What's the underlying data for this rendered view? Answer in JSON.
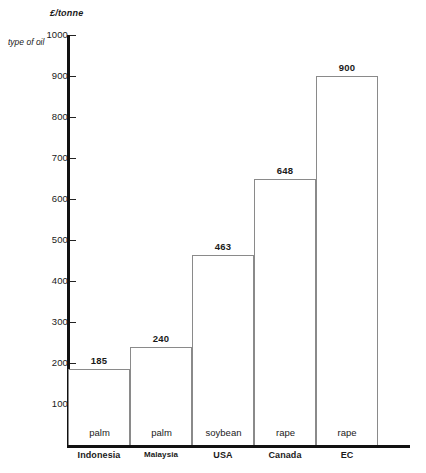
{
  "chart_data": {
    "type": "bar",
    "title": "",
    "xlabel": "",
    "ylabel": "£/tonne",
    "ylim": [
      0,
      1000
    ],
    "yticks": [
      100,
      200,
      300,
      400,
      500,
      600,
      700,
      800,
      900,
      1000
    ],
    "grid": false,
    "legend": "none",
    "categories": [
      "Indonesia",
      "Malaysia",
      "USA",
      "Canada",
      "EC"
    ],
    "values": [
      185,
      240,
      463,
      648,
      900
    ],
    "value_labels": [
      "185",
      "240",
      "463",
      "648",
      "900"
    ],
    "row_label": "type of oil",
    "oil_types": [
      "palm",
      "palm",
      "soybean",
      "rape",
      "rape"
    ],
    "series": [
      {
        "name": "price",
        "values": [
          185,
          240,
          463,
          648,
          900
        ]
      }
    ],
    "points": [
      {
        "category": "Indonesia",
        "oil": "palm",
        "value": 185
      },
      {
        "category": "Malaysia",
        "oil": "palm",
        "value": 240
      },
      {
        "category": "USA",
        "oil": "soybean",
        "value": 463
      },
      {
        "category": "Canada",
        "oil": "rape",
        "value": 648
      },
      {
        "category": "EC",
        "oil": "rape",
        "value": 900
      }
    ],
    "colors": {
      "bar_fill": "#ffffff",
      "bar_stroke": "#8a8a8a",
      "axis": "#111111",
      "text": "#1a1a1a"
    }
  },
  "bottom_caption": ""
}
